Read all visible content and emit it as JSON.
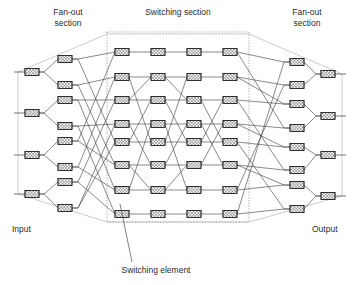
{
  "figure": {
    "background_color": "#ffffff",
    "width": 361,
    "height": 285
  },
  "labels": {
    "fan_out_left_line1": "Fan-out",
    "fan_out_left_line2": "section",
    "switching_section": "Switching section",
    "fan_out_right_line1": "Fan-out",
    "fan_out_right_line2": "section",
    "input": "Input",
    "output": "Output",
    "switching_element": "Switching element"
  },
  "colors": {
    "wire": "#3a3a3a",
    "envelope": "#b8b8b8",
    "section_border": "#7d7d7d",
    "element_stroke": "#1c1c1c",
    "element_fill": "#ffffff",
    "text": "#2b2b2b"
  },
  "geometry": {
    "element_width": 14,
    "element_height": 7,
    "input_ports": 4,
    "output_ports": 4,
    "fanout_stage_count": 8,
    "switching_columns": 4,
    "switching_rows": 8,
    "section_box": {
      "x1": 107,
      "y1": 32,
      "x2": 249,
      "y2": 222
    }
  },
  "label_positions": {
    "fan_out_left": {
      "x": 68,
      "y": 13
    },
    "switching": {
      "x": 178,
      "y": 13
    },
    "fan_out_right": {
      "x": 307,
      "y": 13
    },
    "input": {
      "x": 12,
      "y": 230
    },
    "output": {
      "x": 312,
      "y": 230
    },
    "switching_element": {
      "x": 156,
      "y": 271
    }
  },
  "leader_line": {
    "from": {
      "x": 132,
      "y": 262
    },
    "to": {
      "x": 120,
      "y": 204
    }
  },
  "nodes": {
    "input_terminals": [
      {
        "id": "IN0",
        "x": 32,
        "y": 72
      },
      {
        "id": "IN1",
        "x": 32,
        "y": 113
      },
      {
        "id": "IN2",
        "x": 32,
        "y": 155
      },
      {
        "id": "IN3",
        "x": 32,
        "y": 194
      }
    ],
    "fanout_left": [
      {
        "id": "FL0",
        "x": 65,
        "y": 59
      },
      {
        "id": "FL1",
        "x": 65,
        "y": 85
      },
      {
        "id": "FL2",
        "x": 65,
        "y": 100
      },
      {
        "id": "FL3",
        "x": 65,
        "y": 126
      },
      {
        "id": "FL4",
        "x": 65,
        "y": 141
      },
      {
        "id": "FL5",
        "x": 65,
        "y": 167
      },
      {
        "id": "FL6",
        "x": 65,
        "y": 182
      },
      {
        "id": "FL7",
        "x": 65,
        "y": 208
      }
    ],
    "switch_columns_x": [
      122,
      158,
      194,
      230
    ],
    "switch_rows_y": [
      52,
      77,
      100,
      124,
      142,
      165,
      190,
      214
    ],
    "fanout_right": [
      {
        "id": "FR0",
        "x": 297,
        "y": 62
      },
      {
        "id": "FR1",
        "x": 297,
        "y": 85
      },
      {
        "id": "FR2",
        "x": 297,
        "y": 104
      },
      {
        "id": "FR3",
        "x": 297,
        "y": 128
      },
      {
        "id": "FR4",
        "x": 297,
        "y": 147
      },
      {
        "id": "FR5",
        "x": 297,
        "y": 170
      },
      {
        "id": "FR6",
        "x": 297,
        "y": 185
      },
      {
        "id": "FR7",
        "x": 297,
        "y": 209
      }
    ],
    "output_terminals": [
      {
        "id": "OUT0",
        "x": 328,
        "y": 74
      },
      {
        "id": "OUT1",
        "x": 328,
        "y": 116
      },
      {
        "id": "OUT2",
        "x": 328,
        "y": 155
      },
      {
        "id": "OUT3",
        "x": 328,
        "y": 196
      }
    ]
  },
  "envelope_outline": [
    {
      "x": 18,
      "y": 72
    },
    {
      "x": 18,
      "y": 194
    },
    {
      "x": 107,
      "y": 222
    },
    {
      "x": 249,
      "y": 222
    },
    {
      "x": 342,
      "y": 196
    },
    {
      "x": 342,
      "y": 74
    },
    {
      "x": 249,
      "y": 34
    },
    {
      "x": 107,
      "y": 34
    }
  ]
}
